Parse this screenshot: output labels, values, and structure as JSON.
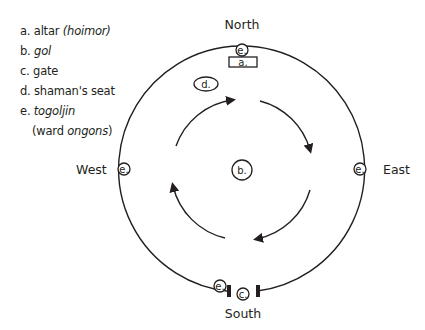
{
  "legend": {
    "items": [
      {
        "key": "a.",
        "text": "altar ",
        "italic": "(hoimor)"
      },
      {
        "key": "b.",
        "text": "",
        "italic": "gol"
      },
      {
        "key": "c.",
        "text": "gate",
        "italic": ""
      },
      {
        "key": "d.",
        "text": "shaman's seat",
        "italic": ""
      },
      {
        "key": "e.",
        "text": "",
        "italic": "togoljin"
      }
    ],
    "continuation": {
      "prefix": "(ward ",
      "italic": "ongons",
      "suffix": ")"
    }
  },
  "directions": {
    "north": "North",
    "south": "South",
    "east": "East",
    "west": "West"
  },
  "markers": {
    "altar": "a.",
    "gol": "b.",
    "gate": "c.",
    "shaman_seat": "d.",
    "togoljin": "e."
  },
  "diagram": {
    "outer_circle": {
      "cx": 242,
      "cy": 169,
      "r": 123
    },
    "inner_flow": {
      "direction": "clockwise",
      "arrows": 4
    },
    "stroke_color": "#231f20"
  }
}
